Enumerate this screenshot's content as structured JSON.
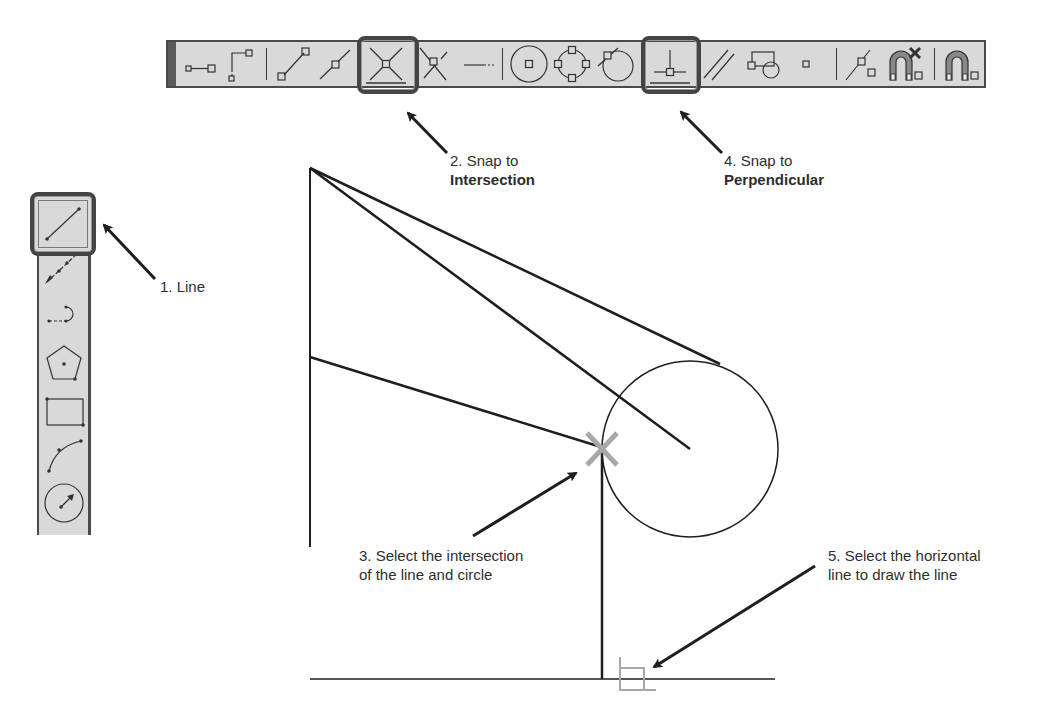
{
  "horizontal_toolbar": {
    "name": "Object Snap toolbar",
    "buttons": [
      {
        "id": "temp-track",
        "icon": "temporary-tracking-point-icon"
      },
      {
        "id": "snap-from",
        "icon": "snap-from-icon"
      },
      {
        "id": "endpoint",
        "icon": "snap-endpoint-icon"
      },
      {
        "id": "midpoint",
        "icon": "snap-midpoint-icon"
      },
      {
        "id": "intersection",
        "icon": "snap-intersection-icon",
        "highlighted": true
      },
      {
        "id": "apparent-intersection",
        "icon": "snap-apparent-intersection-icon"
      },
      {
        "id": "extension",
        "icon": "snap-extension-icon"
      },
      {
        "id": "center",
        "icon": "snap-center-icon"
      },
      {
        "id": "quadrant",
        "icon": "snap-quadrant-icon"
      },
      {
        "id": "tangent",
        "icon": "snap-tangent-icon"
      },
      {
        "id": "perpendicular",
        "icon": "snap-perpendicular-icon",
        "highlighted": true
      },
      {
        "id": "parallel",
        "icon": "snap-parallel-icon"
      },
      {
        "id": "insert",
        "icon": "snap-insert-icon"
      },
      {
        "id": "node",
        "icon": "snap-node-icon"
      },
      {
        "id": "nearest",
        "icon": "snap-nearest-icon"
      },
      {
        "id": "none",
        "icon": "snap-none-icon"
      },
      {
        "id": "osnap-settings",
        "icon": "osnap-settings-icon"
      }
    ]
  },
  "vertical_toolbar": {
    "name": "Draw toolbar",
    "buttons": [
      {
        "id": "line",
        "icon": "line-icon",
        "highlighted": true
      },
      {
        "id": "construction-line",
        "icon": "construction-line-icon"
      },
      {
        "id": "polyline",
        "icon": "polyline-icon"
      },
      {
        "id": "polygon",
        "icon": "polygon-icon"
      },
      {
        "id": "rectangle",
        "icon": "rectangle-icon"
      },
      {
        "id": "arc",
        "icon": "arc-icon"
      },
      {
        "id": "circle",
        "icon": "circle-icon"
      }
    ]
  },
  "callouts": {
    "step1": {
      "text": "1. Line"
    },
    "step2": {
      "line1": "2. Snap to",
      "line2": "Intersection"
    },
    "step3": {
      "line1": "3. Select the intersection",
      "line2": "of the line and circle"
    },
    "step4": {
      "line1": "4. Snap to",
      "line2": "Perpendicular"
    },
    "step5": {
      "line1": "5. Select the horizontal",
      "line2": "line to draw the line"
    }
  },
  "colors": {
    "toolbar_bg": "#d9d9d9",
    "toolbar_border": "#4a4a4a",
    "drawing_line": "#1e1e1e",
    "snap_marker": "#a8a8a8"
  }
}
